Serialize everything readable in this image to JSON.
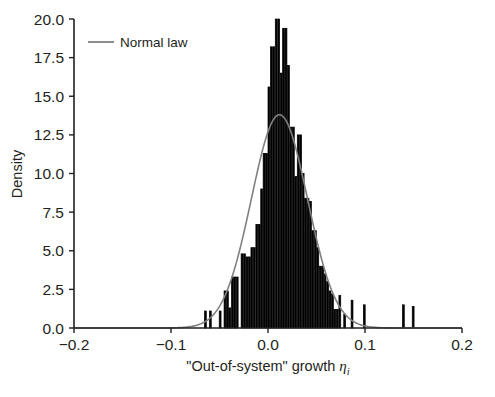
{
  "chart_data": {
    "type": "bar",
    "title": "",
    "subtitle": "",
    "xlabel": "\"Out-of-system\" growth ηᵢ",
    "xlabel_text": "\"Out-of-system\" growth ",
    "xlabel_symbol": "η",
    "xlabel_subscript": "i",
    "ylabel": "Density",
    "xlim": [
      -0.2,
      0.2
    ],
    "ylim": [
      0.0,
      20.0
    ],
    "grid": false,
    "legend_position": "top-left",
    "legend": [
      {
        "label": "Normal law",
        "type": "line",
        "color": "#808080"
      }
    ],
    "xticks": [
      -0.2,
      -0.1,
      0.0,
      0.1,
      0.2
    ],
    "xticklabels": [
      "−0.2",
      "−0.1",
      "0.0",
      "0.1",
      "0.2"
    ],
    "yticks": [
      0.0,
      2.5,
      5.0,
      7.5,
      10.0,
      12.5,
      15.0,
      17.5,
      20.0
    ],
    "yticklabels": [
      "0.0",
      "2.5",
      "5.0",
      "7.5",
      "10.0",
      "12.5",
      "15.0",
      "17.5",
      "20.0"
    ],
    "bar_color": "#000000",
    "bar_edge_color": "#000000",
    "bin_width": 0.00252,
    "histogram": {
      "note": "Histogram of \"out-of-system\" growth; bin left edges and density heights",
      "bin_edges": [
        -0.0655,
        -0.063,
        -0.0604,
        -0.0579,
        -0.0554,
        -0.0529,
        -0.0503,
        -0.0478,
        -0.0453,
        -0.0428,
        -0.0403,
        -0.0377,
        -0.0352,
        -0.0327,
        -0.0302,
        -0.0277,
        -0.0251,
        -0.0226,
        -0.0201,
        -0.0176,
        -0.0151,
        -0.0125,
        -0.01,
        -0.0075,
        -0.005,
        -0.0025,
        0.0,
        0.0025,
        0.005,
        0.0075,
        0.0101,
        0.0126,
        0.0151,
        0.0176,
        0.0201,
        0.0227,
        0.0252,
        0.0277,
        0.0302,
        0.0327,
        0.0353,
        0.0378,
        0.0403,
        0.0428,
        0.0453,
        0.0479,
        0.0504,
        0.0529,
        0.0554,
        0.0579,
        0.0605,
        0.063,
        0.0655,
        0.068,
        0.0705,
        0.0731,
        0.0756,
        0.0781,
        0.0806,
        0.0831,
        0.0857,
        0.0882,
        0.0907,
        0.0932,
        0.0957,
        0.0983,
        0.1008,
        0.1033,
        0.1058,
        0.1083,
        0.1109,
        0.1134,
        0.1159,
        0.1184,
        0.1209,
        0.1235,
        0.126,
        0.1285,
        0.131,
        0.1335,
        0.1361,
        0.1386,
        0.1411,
        0.1436,
        0.1461,
        0.1487,
        0.1512
      ],
      "densities": [
        1.1,
        0.0,
        1.1,
        0.0,
        0.0,
        0.0,
        1.1,
        0.0,
        2.4,
        2.4,
        1.3,
        3.3,
        3.3,
        3.3,
        0.0,
        4.8,
        4.8,
        4.6,
        4.6,
        5.2,
        5.2,
        6.7,
        6.7,
        9.0,
        11.3,
        11.3,
        15.6,
        18.2,
        18.2,
        20.0,
        20.0,
        16.5,
        19.4,
        19.4,
        17.0,
        13.0,
        13.0,
        9.8,
        12.5,
        12.5,
        10.0,
        8.4,
        8.4,
        8.2,
        6.3,
        6.3,
        5.2,
        4.0,
        4.0,
        3.5,
        3.0,
        2.4,
        2.2,
        1.2,
        1.2,
        2.1,
        0.0,
        0.9,
        0.0,
        0.0,
        1.8,
        0.0,
        0.0,
        0.0,
        0.0,
        1.5,
        0.0,
        0.0,
        0.0,
        0.0,
        0.0,
        0.0,
        0.0,
        0.0,
        0.0,
        0.0,
        0.0,
        0.0,
        0.0,
        0.0,
        0.0,
        1.5,
        0.0,
        0.0,
        0.0,
        1.4,
        0.0
      ]
    },
    "normal_law": {
      "label": "Normal law",
      "color": "#808080",
      "mean": 0.0118,
      "std": 0.0289,
      "peak_density": 13.8
    }
  },
  "axes": {
    "xlabel_parts": {
      "text": "\"Out-of-system\" growth ",
      "symbol": "η",
      "subscript": "i"
    },
    "ylabel": "Density"
  }
}
